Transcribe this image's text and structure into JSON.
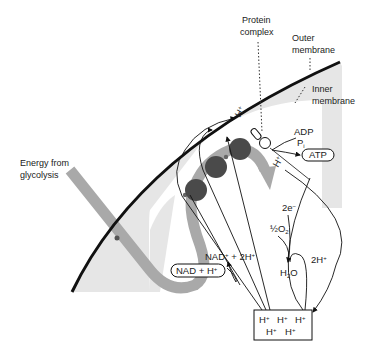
{
  "diagram": {
    "colors": {
      "background": "#ffffff",
      "intermembrane_space": "#e6e6e6",
      "electron_path": "#a9a9a9",
      "protein_carriers": "#4a4a4a",
      "outline": "#111111"
    },
    "labels": {
      "protein_complex_line1": "Protein",
      "protein_complex_line2": "complex",
      "outer_membrane_line1": "Outer",
      "outer_membrane_line2": "membrane",
      "inner_membrane_line1": "Inner",
      "inner_membrane_line2": "membrane",
      "energy_line1": "Energy from",
      "energy_line2": "glycolysis"
    },
    "chemistry": {
      "adp": "ADP",
      "pi": "P",
      "pi_sub": "i",
      "atp": "ATP",
      "h_plus_top": "H",
      "h_plus_synthase": "H",
      "plus": "+",
      "two_e": "2e",
      "minus": "−",
      "half_o2": "½O",
      "o2_sub": "2",
      "h2o_h": "H",
      "h2o_sub": "2",
      "h2o_o": "O",
      "two_h": "2H",
      "nad_plus": "NAD",
      "nad_plus_rest": " + 2H",
      "nadh": "NAD + H",
      "electron": "e",
      "proton_pool": [
        "H",
        "H",
        "H",
        "H",
        "H"
      ]
    },
    "carriers_count": 3
  }
}
